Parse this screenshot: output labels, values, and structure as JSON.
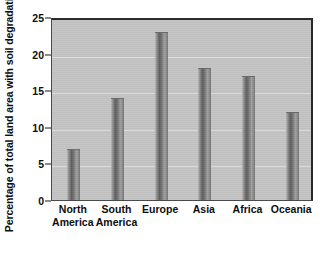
{
  "chart_data": {
    "type": "bar",
    "title": "",
    "subtitle": "",
    "xlabel": "",
    "ylabel": "Percentage of total land area with soil degradation",
    "categories": [
      "North America",
      "South America",
      "Europe",
      "Asia",
      "Africa",
      "Oceania"
    ],
    "category_lines": [
      [
        "North",
        "America"
      ],
      [
        "South",
        "America"
      ],
      [
        "Europe",
        ""
      ],
      [
        "Asia",
        ""
      ],
      [
        "Africa",
        ""
      ],
      [
        "Oceania",
        ""
      ]
    ],
    "values": [
      7,
      14,
      23,
      18,
      17,
      12
    ],
    "ylim": [
      0,
      25
    ],
    "yticks": [
      0,
      5,
      10,
      15,
      20,
      25
    ],
    "ytick_labels": [
      "0",
      "5",
      "10",
      "15",
      "20",
      "25"
    ],
    "grid": true,
    "grid_axis": "y",
    "legend": "none",
    "units": "percent"
  },
  "style": {
    "plot_background": "#c3c3c3",
    "page_background": "#ffffff",
    "gridline_color": "#e2e2e2",
    "axis_color": "#2b2b2b",
    "bar_color_dark": "#5e5e5e",
    "bar_color_light": "#b9b9b9",
    "text_color": "#0d0d0d"
  }
}
